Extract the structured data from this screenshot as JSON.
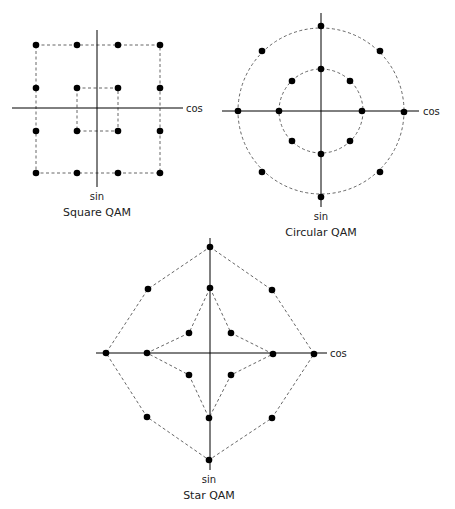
{
  "diagrams": [
    {
      "id": "square",
      "title": "Square QAM",
      "x_axis_label": "cos",
      "y_axis_label": "sin",
      "axis": {
        "cx": 97,
        "cy": 108,
        "x1": 12,
        "x2": 183,
        "y1": 30,
        "y2": 187
      },
      "outlines": [
        {
          "type": "rect",
          "x": 36,
          "y": 45,
          "w": 124,
          "h": 128
        },
        {
          "type": "rect",
          "x": 77,
          "y": 88,
          "w": 41,
          "h": 43
        }
      ],
      "points": [
        [
          36,
          45
        ],
        [
          77,
          45
        ],
        [
          118,
          45
        ],
        [
          160,
          45
        ],
        [
          36,
          88
        ],
        [
          77,
          88
        ],
        [
          118,
          88
        ],
        [
          160,
          88
        ],
        [
          36,
          131
        ],
        [
          77,
          131
        ],
        [
          118,
          131
        ],
        [
          160,
          131
        ],
        [
          36,
          173
        ],
        [
          77,
          173
        ],
        [
          118,
          173
        ],
        [
          160,
          173
        ]
      ],
      "labels": {
        "cos": [
          186,
          112
        ],
        "sin": [
          97,
          200
        ],
        "title": [
          97,
          216
        ]
      }
    },
    {
      "id": "circular",
      "title": "Circular QAM",
      "x_axis_label": "cos",
      "y_axis_label": "sin",
      "axis": {
        "cx": 321,
        "cy": 111,
        "x1": 222,
        "x2": 419,
        "y1": 13,
        "y2": 207
      },
      "outlines": [
        {
          "type": "circle",
          "cx": 321,
          "cy": 111,
          "r": 83
        },
        {
          "type": "circle",
          "cx": 321,
          "cy": 111,
          "r": 42
        }
      ],
      "points": [
        [
          321,
          26
        ],
        [
          262,
          51
        ],
        [
          380,
          51
        ],
        [
          238,
          111
        ],
        [
          404,
          112
        ],
        [
          262,
          172
        ],
        [
          380,
          172
        ],
        [
          321,
          197
        ],
        [
          321,
          69
        ],
        [
          292,
          81
        ],
        [
          350,
          81
        ],
        [
          279,
          111
        ],
        [
          362,
          111
        ],
        [
          292,
          141
        ],
        [
          350,
          141
        ],
        [
          321,
          154
        ]
      ],
      "labels": {
        "cos": [
          423,
          115
        ],
        "sin": [
          321,
          220
        ],
        "title": [
          321,
          236
        ]
      }
    },
    {
      "id": "star",
      "title": "Star QAM",
      "x_axis_label": "cos",
      "y_axis_label": "sin",
      "axis": {
        "cx": 210,
        "cy": 353,
        "x1": 96,
        "x2": 327,
        "y1": 238,
        "y2": 470
      },
      "outlines": [
        {
          "type": "polygon",
          "points": "210,247 272,290 314,354 272,418 209,460 147,417 106,353 148,289"
        },
        {
          "type": "polygon",
          "points": "210,288 231,333 273,354 231,375 209,418 189,375 147,353 189,333"
        }
      ],
      "points": [
        [
          210,
          247
        ],
        [
          148,
          289
        ],
        [
          272,
          290
        ],
        [
          106,
          353
        ],
        [
          314,
          354
        ],
        [
          147,
          417
        ],
        [
          272,
          418
        ],
        [
          209,
          460
        ],
        [
          210,
          288
        ],
        [
          189,
          333
        ],
        [
          231,
          333
        ],
        [
          147,
          353
        ],
        [
          273,
          354
        ],
        [
          189,
          375
        ],
        [
          231,
          375
        ],
        [
          209,
          418
        ]
      ],
      "labels": {
        "cos": [
          330,
          357
        ],
        "sin": [
          209,
          483
        ],
        "title": [
          209,
          499
        ]
      }
    }
  ]
}
